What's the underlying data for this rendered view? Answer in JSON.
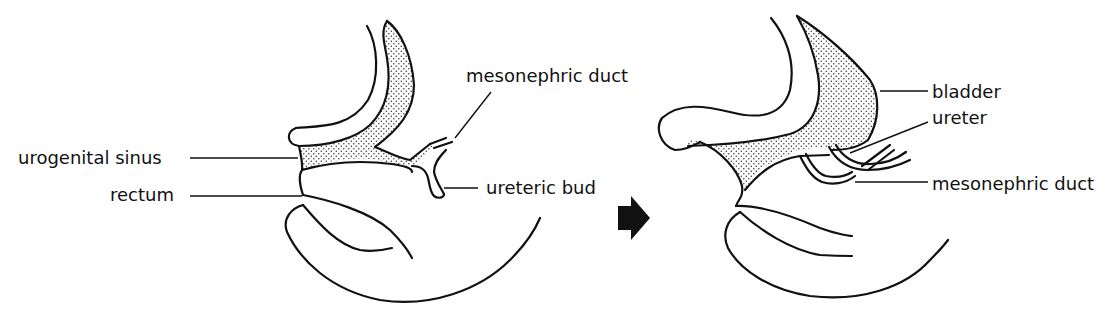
{
  "figure": {
    "panels": [
      {
        "id": "early",
        "labels": {
          "urogenital_sinus": "urogenital  sinus",
          "rectum": "rectum",
          "mesonephric_duct": "mesonephric duct",
          "ureteric_bud": "ureteric  bud"
        }
      },
      {
        "id": "later",
        "labels": {
          "bladder": "bladder",
          "ureter": "ureter",
          "mesonephric_duct": "mesonephric  duct"
        }
      }
    ],
    "transition_arrow": "right-arrow",
    "colors": {
      "ink": "#111111",
      "background": "#ffffff"
    }
  }
}
